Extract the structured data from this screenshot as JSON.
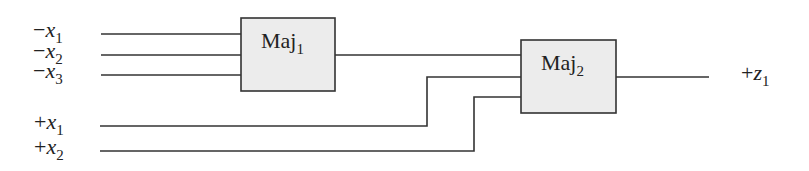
{
  "diagram": {
    "type": "majority-gate network",
    "colors": {
      "line": "#333333",
      "box_fill": "#ececec",
      "box_stroke": "#333333"
    },
    "inputs": [
      {
        "sign": "−",
        "var": "x",
        "sub": "1"
      },
      {
        "sign": "−",
        "var": "x",
        "sub": "2"
      },
      {
        "sign": "−",
        "var": "x",
        "sub": "3"
      },
      {
        "sign": "+",
        "var": "x",
        "sub": "1"
      },
      {
        "sign": "+",
        "var": "x",
        "sub": "2"
      }
    ],
    "gates": [
      {
        "name": "Maj",
        "sub": "1"
      },
      {
        "name": "Maj",
        "sub": "2"
      }
    ],
    "output": {
      "sign": "+",
      "var": "z",
      "sub": "1"
    }
  }
}
